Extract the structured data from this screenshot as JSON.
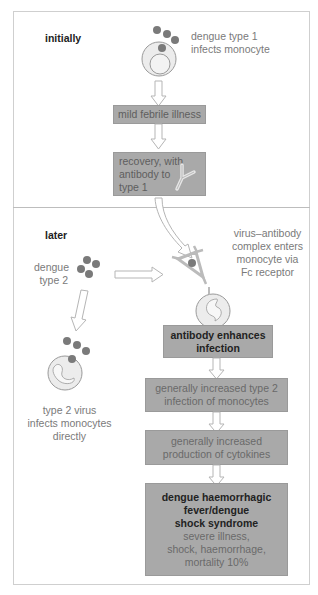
{
  "diagram": {
    "sections": {
      "initially": "initially",
      "later": "later"
    },
    "initial": {
      "infection_caption": [
        "dengue type 1",
        "infects monocyte"
      ],
      "mild_illness": "mild febrile illness",
      "recovery": [
        "recovery, with",
        "antibody to",
        "type 1"
      ]
    },
    "later_stage": {
      "dengue2_label": [
        "dengue",
        "type 2"
      ],
      "complex_caption": [
        "virus–antibody",
        "complex enters",
        "monocyte via",
        "Fc receptor"
      ],
      "direct_caption": [
        "type 2 virus",
        "infects monocytes",
        "directly"
      ],
      "enhance": [
        "antibody enhances",
        "infection"
      ],
      "increased_infection": [
        "generally increased type 2",
        "infection of monocytes"
      ],
      "cytokines": [
        "generally increased",
        "production of cytokines"
      ],
      "dhf_title": [
        "dengue haemorrhagic",
        "fever/dengue",
        "shock syndrome"
      ],
      "dhf_detail": [
        "severe illness,",
        "shock, haemorrhage,",
        "mortality 10%"
      ]
    },
    "colors": {
      "box_fill": "#a9a9a9",
      "virus": "#7a7a7a",
      "cell_fill": "#ececec",
      "arrow_stroke": "#b5b5b5"
    }
  }
}
